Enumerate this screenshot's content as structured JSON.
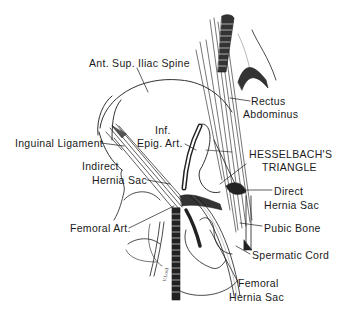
{
  "figure": {
    "type": "anatomical-illustration",
    "ink_color": "#1a1a1a",
    "background": "#ffffff"
  },
  "labels": {
    "ant_sup_iliac_spine": "Ant. Sup. Iliac Spine",
    "rectus_line1": "Rectus",
    "rectus_line2": "Abdominus",
    "inf_epig_line1": "Inf.",
    "inf_epig_line2": "Epig. Art.",
    "inguinal_ligament": "Inguinal Ligament",
    "hesselbach_line1": "HESSELBACH'S",
    "hesselbach_line2": "TRIANGLE",
    "indirect_line1": "Indirect",
    "indirect_line2": "Hernia Sac",
    "direct_line1": "Direct",
    "direct_line2": "Hernia Sac",
    "femoral_art": "Femoral Art.",
    "pubic_bone": "Pubic Bone",
    "spermatic_cord": "Spermatic Cord",
    "femoral_hernia_line1": "Femoral",
    "femoral_hernia_line2": "Hernia Sac"
  }
}
